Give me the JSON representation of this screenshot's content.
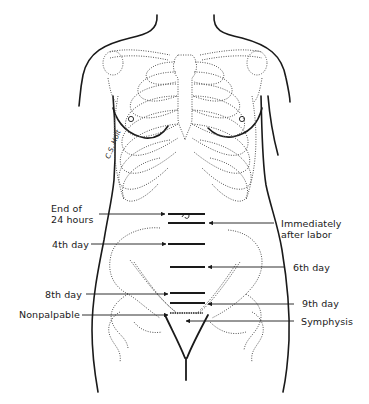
{
  "figure": {
    "type": "anatomical-diagram",
    "signature": "C.S. Holt"
  },
  "labels_left": [
    {
      "id": "end-24-hours",
      "lines": [
        "End of",
        "24 hours"
      ],
      "bar_y": 214
    },
    {
      "id": "4th-day",
      "lines": [
        "4th day"
      ],
      "bar_y": 244
    },
    {
      "id": "8th-day",
      "lines": [
        "8th day"
      ],
      "bar_y": 293
    },
    {
      "id": "nonpalpable",
      "lines": [
        "Nonpalpable"
      ],
      "bar_y": 313
    }
  ],
  "labels_right": [
    {
      "id": "immediately-after-labor",
      "lines": [
        "Immediately",
        "after labor"
      ],
      "bar_y": 223
    },
    {
      "id": "6th-day",
      "lines": [
        "6th day"
      ],
      "bar_y": 267
    },
    {
      "id": "9th-day",
      "lines": [
        "9th day"
      ],
      "bar_y": 303
    },
    {
      "id": "symphysis",
      "lines": [
        "Symphysis"
      ],
      "bar_y": 320
    }
  ],
  "colors": {
    "ink": "#1a1a1a",
    "dotted": "#555555",
    "background": "#ffffff"
  }
}
